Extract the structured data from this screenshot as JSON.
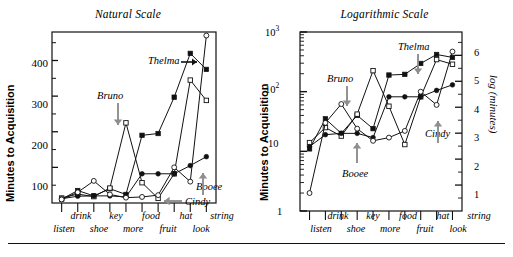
{
  "figure": {
    "panels": [
      {
        "id": "natural",
        "title": "Natural Scale",
        "ylabel": "Minutes to Acquisition",
        "yticks": [
          "100",
          "200",
          "300",
          "400"
        ],
        "annotations": [
          {
            "name": "Thelma",
            "arrow": "right"
          },
          {
            "name": "Bruno",
            "arrow": "down"
          },
          {
            "name": "Booee",
            "arrow": "up"
          },
          {
            "name": "Cindy",
            "arrow": "left"
          }
        ]
      },
      {
        "id": "logarithmic",
        "title": "Logarithmic Scale",
        "ylabel": "Minutes to Acquisition",
        "ylabel_right": "log (minutes)",
        "yticks": [
          "1",
          "10",
          "10²",
          "10³"
        ],
        "yticks_right": [
          "1",
          "2",
          "3",
          "4",
          "5",
          "6"
        ],
        "annotations": [
          {
            "name": "Thelma",
            "arrow": "down"
          },
          {
            "name": "Bruno",
            "arrow": "down"
          },
          {
            "name": "Booee",
            "arrow": "up"
          },
          {
            "name": "Cindy",
            "arrow": "up"
          }
        ]
      }
    ],
    "xtick_labels_upper": [
      "drink",
      "key",
      "food",
      "hat",
      "string"
    ],
    "xtick_labels_lower": [
      "listen",
      "shoe",
      "more",
      "fruit",
      "look"
    ]
  },
  "chart_data": [
    {
      "type": "line",
      "title": "Natural Scale",
      "xlabel": "",
      "ylabel": "Minutes to Acquisition",
      "ylim": [
        0,
        480
      ],
      "yticks": [
        100,
        200,
        300,
        400
      ],
      "grid": false,
      "legend": "inline-annotations",
      "categories": [
        "listen",
        "drink",
        "shoe",
        "key",
        "more",
        "food",
        "fruit",
        "hat",
        "look",
        "string"
      ],
      "series": [
        {
          "name": "Thelma",
          "marker": "filled-square",
          "values": [
            11,
            35,
            20,
            40,
            24,
            190,
            195,
            297,
            420,
            375
          ]
        },
        {
          "name": "Bruno",
          "marker": "open-square",
          "values": [
            14,
            25,
            18,
            42,
            225,
            57,
            13,
            82,
            345,
            288
          ]
        },
        {
          "name": "Booee",
          "marker": "filled-circle",
          "values": [
            12,
            19,
            20,
            20,
            17,
            82,
            82,
            82,
            105,
            130
          ]
        },
        {
          "name": "Cindy",
          "marker": "open-circle",
          "values": [
            10,
            30,
            62,
            24,
            15,
            17,
            22,
            100,
            60,
            470
          ]
        }
      ]
    },
    {
      "type": "line",
      "title": "Logarithmic Scale",
      "xlabel": "",
      "ylabel": "Minutes to Acquisition",
      "ylabel_right": "log (minutes)",
      "yscale": "log",
      "ylim": [
        1,
        1000
      ],
      "yticks": [
        1,
        10,
        100,
        1000
      ],
      "yticks_right": [
        1,
        2,
        3,
        4,
        5,
        6
      ],
      "grid": false,
      "legend": "inline-annotations",
      "categories": [
        "listen",
        "drink",
        "shoe",
        "key",
        "more",
        "food",
        "fruit",
        "hat",
        "look",
        "string"
      ],
      "series": [
        {
          "name": "Thelma",
          "marker": "filled-square",
          "values": [
            11,
            35,
            20,
            40,
            24,
            190,
            195,
            297,
            420,
            375
          ]
        },
        {
          "name": "Bruno",
          "marker": "open-square",
          "values": [
            14,
            25,
            18,
            42,
            225,
            57,
            13,
            82,
            345,
            288
          ]
        },
        {
          "name": "Booee",
          "marker": "filled-circle",
          "values": [
            12,
            19,
            20,
            20,
            17,
            82,
            82,
            82,
            105,
            130
          ]
        },
        {
          "name": "Cindy",
          "marker": "open-circle",
          "values": [
            2,
            30,
            62,
            24,
            15,
            17,
            22,
            100,
            60,
            470
          ]
        }
      ]
    }
  ]
}
